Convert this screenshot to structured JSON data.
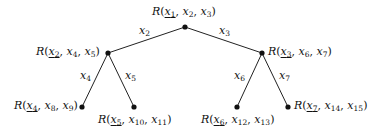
{
  "diagram": {
    "type": "binary-tree",
    "nodes": [
      {
        "id": "root",
        "label": "R(x1, x2, x3)",
        "func": "R",
        "args": [
          "1",
          "2",
          "3"
        ],
        "underlined": 0
      },
      {
        "id": "left",
        "label": "R(x2, x4, x5)",
        "func": "R",
        "args": [
          "2",
          "4",
          "5"
        ],
        "underlined": 0
      },
      {
        "id": "right",
        "label": "R(x3, x6, x7)",
        "func": "R",
        "args": [
          "3",
          "6",
          "7"
        ],
        "underlined": 0
      },
      {
        "id": "ll",
        "label": "R(x4, x8, x9)",
        "func": "R",
        "args": [
          "4",
          "8",
          "9"
        ],
        "underlined": 0
      },
      {
        "id": "lr",
        "label": "R(x5, x10, x11)",
        "func": "R",
        "args": [
          "5",
          "10",
          "11"
        ],
        "underlined": 0
      },
      {
        "id": "rl",
        "label": "R(x6, x12, x13)",
        "func": "R",
        "args": [
          "6",
          "12",
          "13"
        ],
        "underlined": 0
      },
      {
        "id": "rr",
        "label": "R(x7, x14, x15)",
        "func": "R",
        "args": [
          "7",
          "14",
          "15"
        ],
        "underlined": 0
      }
    ],
    "edges": [
      {
        "from": "root",
        "to": "left",
        "label": "x2",
        "sub": "2"
      },
      {
        "from": "root",
        "to": "right",
        "label": "x3",
        "sub": "3"
      },
      {
        "from": "left",
        "to": "ll",
        "label": "x4",
        "sub": "4"
      },
      {
        "from": "left",
        "to": "lr",
        "label": "x5",
        "sub": "5"
      },
      {
        "from": "right",
        "to": "rl",
        "label": "x6",
        "sub": "6"
      },
      {
        "from": "right",
        "to": "rr",
        "label": "x7",
        "sub": "7"
      }
    ]
  }
}
